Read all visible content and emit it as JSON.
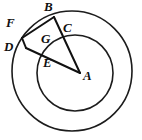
{
  "figure": {
    "background_color": "#ffffff",
    "stroke_color": "#111111",
    "label_color": "#101010",
    "circles": [
      {
        "name": "outer-circle",
        "cx": 72,
        "cy": 71,
        "r": 60
      },
      {
        "name": "inner-circle",
        "cx": 75,
        "cy": 73,
        "r": 38
      }
    ],
    "points": [
      {
        "id": "A",
        "label": "A",
        "x": 80,
        "y": 73,
        "label_x": 84,
        "label_y": 73
      },
      {
        "id": "B",
        "label": "B",
        "x": 54,
        "y": 17,
        "label_x": 45,
        "label_y": 4
      },
      {
        "id": "C",
        "label": "C",
        "x": 63,
        "y": 35,
        "label_x": 64,
        "label_y": 25
      },
      {
        "id": "D",
        "label": "D",
        "x": 26,
        "y": 48,
        "label_x": 5,
        "label_y": 44
      },
      {
        "id": "E",
        "label": "E",
        "x": 51,
        "y": 61,
        "label_x": 44,
        "label_y": 60
      },
      {
        "id": "F",
        "label": "F",
        "x": 22,
        "y": 38,
        "label_x": 7,
        "label_y": 20
      },
      {
        "id": "G",
        "label": "G",
        "x": 47,
        "y": 44,
        "label_x": 42,
        "label_y": 36
      }
    ],
    "segments": [
      {
        "name": "segment-FB",
        "from": "F",
        "to": "B"
      },
      {
        "name": "segment-FD",
        "from": "F",
        "to": "D"
      },
      {
        "name": "segment-BA",
        "from": "B",
        "to": "A"
      },
      {
        "name": "segment-DA",
        "from": "D",
        "to": "A"
      }
    ]
  }
}
